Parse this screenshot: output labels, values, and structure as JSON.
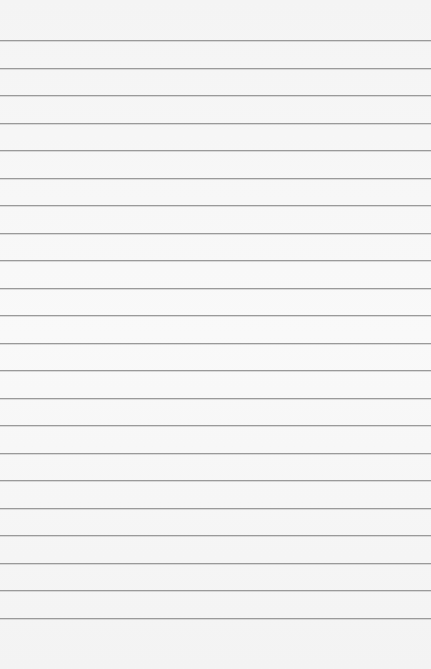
{
  "paper": {
    "background": "#f6f6f6",
    "rule_color": "#9a9a9a",
    "first_rule_y": 40,
    "rule_spacing": 27.5,
    "rule_count": 22
  }
}
